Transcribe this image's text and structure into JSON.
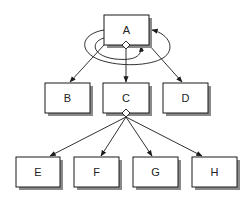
{
  "diagram": {
    "type": "tree-hierarchy",
    "colors": {
      "background": "#ffffff",
      "box_fill": "#ffffff",
      "box_stroke": "#1a1a1a",
      "shadow": "#8a8a8a",
      "line": "#1a1a1a"
    },
    "nodes": [
      {
        "id": "A",
        "label": "A",
        "x": 104,
        "y": 15,
        "w": 45,
        "h": 30
      },
      {
        "id": "B",
        "label": "B",
        "x": 45,
        "y": 83,
        "w": 45,
        "h": 30
      },
      {
        "id": "C",
        "label": "C",
        "x": 103,
        "y": 83,
        "w": 46,
        "h": 30
      },
      {
        "id": "D",
        "label": "D",
        "x": 163,
        "y": 83,
        "w": 45,
        "h": 30
      },
      {
        "id": "E",
        "label": "E",
        "x": 16,
        "y": 157,
        "w": 44,
        "h": 30
      },
      {
        "id": "F",
        "label": "F",
        "x": 74,
        "y": 157,
        "w": 45,
        "h": 30
      },
      {
        "id": "G",
        "label": "G",
        "x": 133,
        "y": 157,
        "w": 45,
        "h": 30
      },
      {
        "id": "H",
        "label": "H",
        "x": 192,
        "y": 157,
        "w": 45,
        "h": 30
      }
    ],
    "edges": [
      {
        "from": "A",
        "to": "B",
        "style": "arrow"
      },
      {
        "from": "A",
        "to": "C",
        "style": "arrow",
        "source_marker": "diamond"
      },
      {
        "from": "A",
        "to": "D",
        "style": "arrow"
      },
      {
        "from": "C",
        "to": "E",
        "style": "arrow",
        "source_marker": "diamond"
      },
      {
        "from": "C",
        "to": "F",
        "style": "arrow",
        "source_marker": "diamond"
      },
      {
        "from": "C",
        "to": "G",
        "style": "arrow",
        "source_marker": "diamond"
      },
      {
        "from": "C",
        "to": "H",
        "style": "arrow",
        "source_marker": "diamond"
      }
    ],
    "self_loops": [
      {
        "node": "A",
        "name": "outer-loop",
        "enters": "right side"
      },
      {
        "node": "A",
        "name": "inner-loop",
        "enters": "bottom side"
      }
    ]
  }
}
